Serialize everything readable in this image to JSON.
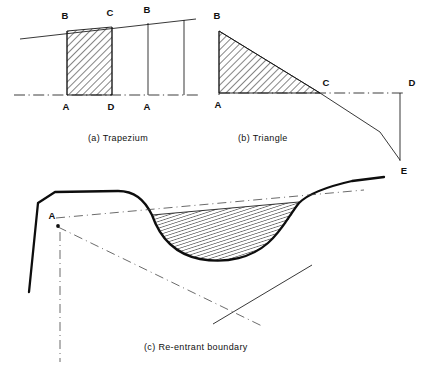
{
  "figure": {
    "background_color": "#ffffff",
    "ink_color": "#101010",
    "panels": [
      {
        "id": "a",
        "caption": "(a)  Trapezium",
        "shape_type": "trapezium",
        "vertex_labels": [
          "B",
          "C",
          "B",
          "A",
          "D",
          "A"
        ],
        "hatched": true,
        "hatch_angle_deg": 45
      },
      {
        "id": "b",
        "caption": "(b)  Triangle",
        "shape_type": "triangle",
        "vertex_labels": [
          "B",
          "C",
          "D",
          "A",
          "E"
        ],
        "hatched": true,
        "hatch_angle_deg": 45
      },
      {
        "id": "c",
        "caption": "(c)  Re-entrant boundary",
        "shape_type": "re-entrant-boundary",
        "vertex_labels": [
          "A"
        ],
        "hatched": true,
        "hatch_angle_deg": 75
      }
    ]
  },
  "panel_a": {
    "caption": "(a)  Trapezium",
    "labels": {
      "b_left": "B",
      "c_top": "C",
      "b_right": "B",
      "a_left": "A",
      "d_mid": "D",
      "a_right": "A"
    }
  },
  "panel_b": {
    "caption": "(b)  Triangle",
    "labels": {
      "b_top": "B",
      "c_axis": "C",
      "d_right": "D",
      "a_base": "A",
      "e_bottom": "E"
    }
  },
  "panel_c": {
    "caption": "(c)  Re-entrant boundary",
    "labels": {
      "a_vertex": "A"
    }
  }
}
